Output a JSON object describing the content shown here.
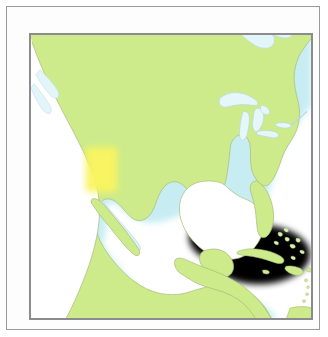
{
  "document": {
    "kind": "map-figure",
    "title": "North America reference map"
  },
  "map": {
    "region_name": "North America",
    "projection_extent": {
      "west_label": "Pacific Ocean",
      "east_label": "Atlantic Ocean"
    },
    "colors": {
      "land": "#cdeb8b",
      "land_edge": "#a8bd7c",
      "ocean": "#ffffff",
      "shelf_water": "#d7f2f6",
      "lake": "#e9f8fb",
      "lake_edge": "#bcd9e2",
      "highlight": "#faf45f",
      "frame": "#8c8c90",
      "page_frame": "#9a9a9e",
      "page": "#fdfdfd"
    },
    "highlight": {
      "label": "highlighted-area",
      "description": "Soft yellow rectangular highlight over the southwestern United States",
      "x": 78,
      "y": 140,
      "width": 32,
      "height": 45
    },
    "features": {
      "landmasses": [
        "Canada",
        "United States",
        "Mexico",
        "Central America"
      ],
      "water_bodies": [
        "Pacific Ocean",
        "Atlantic Ocean",
        "Gulf of Mexico",
        "Caribbean Sea",
        "Hudson Bay",
        "James Bay",
        "Gulf of California",
        "Great Lakes"
      ],
      "great_lakes": [
        "Lake Superior",
        "Lake Michigan",
        "Lake Huron",
        "Lake Erie",
        "Lake Ontario"
      ],
      "islands": [
        "Cuba",
        "Hispaniola",
        "Jamaica",
        "Bahamas",
        "Baja California Peninsula",
        "Puerto Rico"
      ],
      "peninsulas": [
        "Florida",
        "Yucatan",
        "Baja California"
      ]
    },
    "labels": []
  }
}
